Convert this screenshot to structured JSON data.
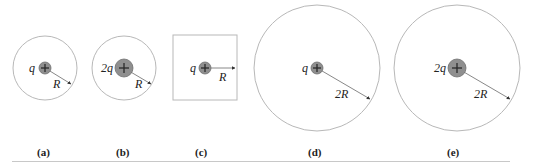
{
  "figure": {
    "panels": [
      {
        "id": "a",
        "caption": "(a)",
        "charge_label": "q",
        "radius_label": "R",
        "surface": "sphere",
        "surface_size": "small"
      },
      {
        "id": "b",
        "caption": "(b)",
        "charge_label": "2q",
        "radius_label": "R",
        "surface": "sphere",
        "surface_size": "small"
      },
      {
        "id": "c",
        "caption": "(c)",
        "charge_label": "q",
        "radius_label": "R",
        "surface": "cube",
        "surface_size": "small"
      },
      {
        "id": "d",
        "caption": "(d)",
        "charge_label": "q",
        "radius_label": "2R",
        "surface": "sphere",
        "surface_size": "large"
      },
      {
        "id": "e",
        "caption": "(e)",
        "charge_label": "2q",
        "radius_label": "2R",
        "surface": "sphere",
        "surface_size": "large"
      }
    ],
    "charge_sign": "+",
    "colors": {
      "boundary": "#b8b8b8",
      "charge_fill": "#8f8f8f",
      "text": "#222222",
      "rule": "#c8c8c8"
    }
  }
}
